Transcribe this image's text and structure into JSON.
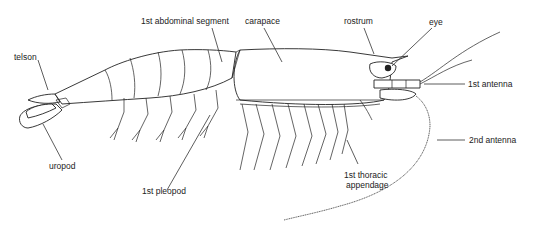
{
  "diagram": {
    "labels": [
      {
        "id": "telson",
        "text": "telson"
      },
      {
        "id": "abdominal",
        "text": "1st abdominal segment"
      },
      {
        "id": "carapace",
        "text": "carapace"
      },
      {
        "id": "rostrum",
        "text": "rostrum"
      },
      {
        "id": "eye",
        "text": "eye"
      },
      {
        "id": "antenna1",
        "text": "1st antenna"
      },
      {
        "id": "antenna2",
        "text": "2nd antenna"
      },
      {
        "id": "uropod",
        "text": "uropod"
      },
      {
        "id": "pleopod",
        "text": "1st pleopod"
      },
      {
        "id": "thoracic1",
        "text": "1st thoracic"
      },
      {
        "id": "thoracic2",
        "text": "appendage"
      }
    ]
  }
}
